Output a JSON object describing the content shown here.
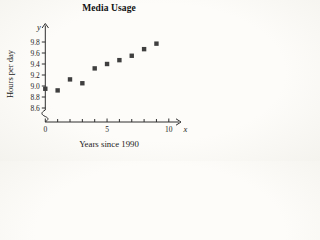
{
  "chart_data": {
    "type": "scatter",
    "title": "Media Usage",
    "xlabel": "Years since 1990",
    "ylabel": "Hours per day",
    "x_axis_letter": "x",
    "y_axis_letter": "y",
    "x": [
      0,
      1,
      2,
      3,
      4,
      5,
      6,
      7,
      8,
      9
    ],
    "y": [
      8.95,
      8.92,
      9.12,
      9.05,
      9.32,
      9.4,
      9.47,
      9.55,
      9.67,
      9.77
    ],
    "xlim": [
      0,
      11
    ],
    "ylim": [
      8.45,
      9.95
    ],
    "axis_break_on_y": true,
    "x_major_ticks": [
      0,
      5,
      10
    ],
    "x_tick_labels": [
      "0",
      "5",
      "10"
    ],
    "x_minor_ticks": [
      1,
      2,
      3,
      4,
      6,
      7,
      8,
      9
    ],
    "y_ticks": [
      8.6,
      8.8,
      9.0,
      9.2,
      9.4,
      9.6,
      9.8
    ],
    "y_tick_labels": [
      "8.6",
      "8.8",
      "9.0",
      "9.2",
      "9.4",
      "9.6",
      "9.8"
    ],
    "legend": null,
    "grid": false,
    "marker_shape": "square",
    "marker_color": "#3f3f3f",
    "axis_color": "#2e2e2e",
    "text_color": "#1d1d1d"
  }
}
